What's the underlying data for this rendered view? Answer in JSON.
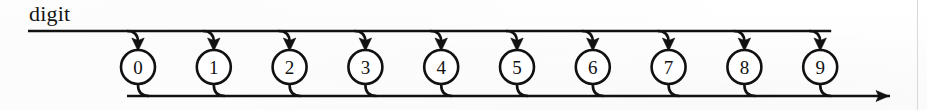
{
  "diagram": {
    "kind": "railroad-syntax-diagram",
    "title": "digit",
    "label": "digit",
    "nodes": [
      {
        "label": "0"
      },
      {
        "label": "1"
      },
      {
        "label": "2"
      },
      {
        "label": "3"
      },
      {
        "label": "4"
      },
      {
        "label": "5"
      },
      {
        "label": "6"
      },
      {
        "label": "7"
      },
      {
        "label": "8"
      },
      {
        "label": "9"
      }
    ],
    "geometry": {
      "top_rail_y": 31,
      "bottom_rail_y": 96,
      "node_center_y": 67,
      "node_radius": 17,
      "first_node_cx": 138,
      "node_spacing": 75.8,
      "top_rail_start_x": 28,
      "bottom_rail_end_x": 890,
      "underline_y": 30,
      "underline_start_x": 28,
      "page_edge_x": 917
    },
    "colors": {
      "ink": "#111111",
      "paper": "#fefefe",
      "page_edge": "#d9d9d9"
    },
    "icons": {
      "arrow_down": "arrow-down-icon",
      "arrow_right": "arrow-right-icon"
    }
  }
}
